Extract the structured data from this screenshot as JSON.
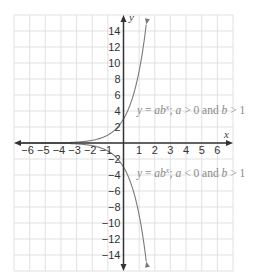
{
  "chart_data": {
    "type": "line",
    "title": "",
    "xlabel": "x",
    "ylabel": "y",
    "xlim": [
      -7,
      7
    ],
    "ylim": [
      -16,
      16
    ],
    "grid": true,
    "x_ticks": [
      -6,
      -5,
      -4,
      -3,
      -2,
      -1,
      1,
      2,
      3,
      4,
      5,
      6
    ],
    "y_ticks": [
      14,
      12,
      10,
      8,
      6,
      4,
      2,
      -2,
      -4,
      -6,
      -8,
      -10,
      -12,
      -14
    ],
    "x_tick_labels": [
      "−6",
      "−5",
      "−4",
      "−3",
      "−2",
      "−1",
      "1",
      "2",
      "3",
      "4",
      "5",
      "6"
    ],
    "y_tick_labels": [
      "14",
      "12",
      "10",
      "8",
      "6",
      "4",
      "2",
      "−2",
      "−4",
      "−6",
      "−8",
      "−10",
      "−12",
      "−14"
    ],
    "series": [
      {
        "name": "y = ab^x; a > 0 and b > 1",
        "function": "y = 3 * 3^x",
        "a": 3,
        "b": 3,
        "x": [
          -7,
          -6,
          -5,
          -4,
          -3,
          -2,
          -1,
          0,
          0.5,
          1,
          1.46
        ],
        "y": [
          0.001,
          0.004,
          0.012,
          0.037,
          0.111,
          0.333,
          1,
          3,
          5.2,
          9,
          15
        ]
      },
      {
        "name": "y = ab^x; a < 0 and b > 1",
        "function": "y = -3 * 3^x",
        "a": -3,
        "b": 3,
        "x": [
          -7,
          -6,
          -5,
          -4,
          -3,
          -2,
          -1,
          0,
          0.5,
          1,
          1.46
        ],
        "y": [
          -0.001,
          -0.004,
          -0.012,
          -0.037,
          -0.111,
          -0.333,
          -1,
          -3,
          -5.2,
          -9,
          -15
        ]
      }
    ],
    "annotations": [
      {
        "text": "y = ab^x; a > 0 and b > 1",
        "near": {
          "x": 0.4,
          "y": 4.5
        }
      },
      {
        "text": "y = ab^x; a < 0 and b > 1",
        "near": {
          "x": 0.4,
          "y": -3.5
        }
      }
    ]
  },
  "labels": {
    "x_axis": "x",
    "y_axis": "y",
    "eq_upper": {
      "y": "y",
      "eq": " = ",
      "a": "a",
      "b": "b",
      "x": "x",
      "rest1": "; ",
      "a2": "a",
      "gt0": " > 0 and ",
      "b2": "b",
      "gt1": " > 1"
    },
    "eq_lower": {
      "y": "y",
      "eq": " = ",
      "a": "a",
      "b": "b",
      "x": "x",
      "rest1": "; ",
      "a2": "a",
      "lt0": " < 0 and ",
      "b2": "b",
      "gt1": " > 1"
    }
  },
  "colors": {
    "grid": "#d9d9d9",
    "axis": "#333333",
    "curve": "#7a7a7a",
    "label": "#333333",
    "equation": "#8a8a8a"
  }
}
